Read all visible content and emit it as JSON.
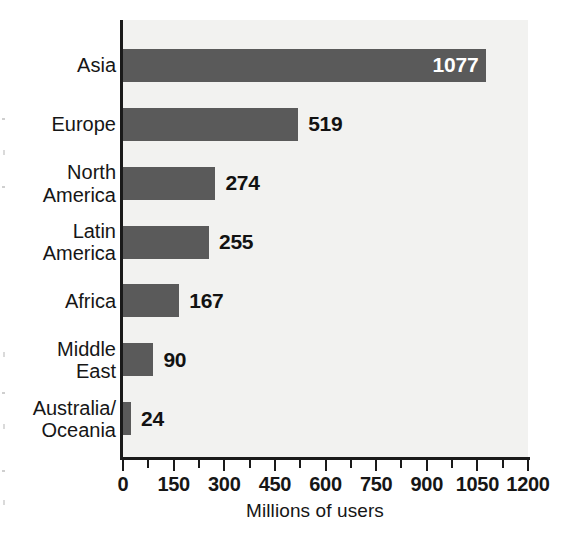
{
  "chart_data": {
    "type": "bar",
    "orientation": "horizontal",
    "title": "",
    "xlabel": "Millions of users",
    "ylabel": "",
    "categories": [
      "Asia",
      "Europe",
      "North\nAmerica",
      "Latin\nAmerica",
      "Africa",
      "Middle\nEast",
      "Australia/\nOceania"
    ],
    "values": [
      1077,
      519,
      274,
      255,
      167,
      90,
      24
    ],
    "value_labels": [
      "1077",
      "519",
      "274",
      "255",
      "167",
      "90",
      "24"
    ],
    "xlim": [
      0,
      1200
    ],
    "xticks": [
      0,
      150,
      300,
      450,
      600,
      750,
      900,
      1050,
      1200
    ],
    "xtick_labels": [
      "0",
      "150",
      "300",
      "450",
      "600",
      "750",
      "900",
      "1050",
      "1200"
    ],
    "minor_tick_step": 75,
    "grid": false,
    "legend": null,
    "bar_color": "#5a5a5a",
    "axis_color": "#1a1a1a",
    "plot_background": "#f2f2f0",
    "inside_label_color": "#ffffff",
    "outside_label_color": "#121212"
  }
}
